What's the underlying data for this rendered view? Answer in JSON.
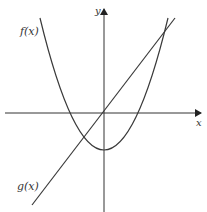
{
  "figure": {
    "labels": {
      "f": "f(x)",
      "g": "g(x)",
      "x_axis": "x",
      "y_axis": "y"
    },
    "colors": {
      "stroke": "#3a3a3a",
      "background": "#ffffff"
    },
    "curves": [
      {
        "name": "f(x)",
        "type": "parabola",
        "opens": "up",
        "vertex_position": "below x-axis on y-axis",
        "description": "upward parabola with vertex on negative y-axis, two x-intercepts"
      },
      {
        "name": "g(x)",
        "type": "line",
        "slope": "positive",
        "description": "line through origin with positive slope, intersects f(x) twice"
      }
    ]
  }
}
